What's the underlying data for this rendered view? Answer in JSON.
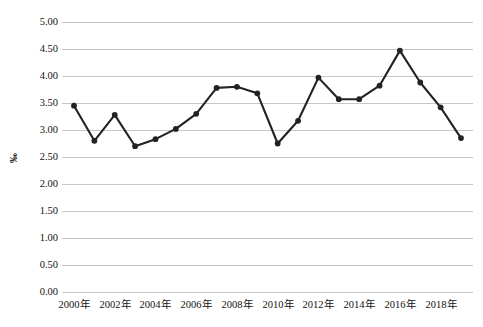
{
  "chart_data": {
    "type": "line",
    "title": "",
    "subtitle": "",
    "xlabel": "",
    "ylabel": "‰",
    "ylim": [
      0.0,
      5.0
    ],
    "y_ticks": [
      "0.00",
      "0.50",
      "1.00",
      "1.50",
      "2.00",
      "2.50",
      "3.00",
      "3.50",
      "4.00",
      "4.50",
      "5.00"
    ],
    "y_tick_values": [
      0.0,
      0.5,
      1.0,
      1.5,
      2.0,
      2.5,
      3.0,
      3.5,
      4.0,
      4.5,
      5.0
    ],
    "grid": true,
    "legend": false,
    "legend_position": "none",
    "marker": "filled-circle",
    "line_color": "#222222",
    "marker_color": "#222222",
    "gridline_color": "#c7c7c7",
    "x": [
      2000,
      2001,
      2002,
      2003,
      2004,
      2005,
      2006,
      2007,
      2008,
      2009,
      2010,
      2011,
      2012,
      2013,
      2014,
      2015,
      2016,
      2017,
      2018,
      2019
    ],
    "x_tick_labels": [
      "2000年",
      "2002年",
      "2004年",
      "2006年",
      "2008年",
      "2010年",
      "2012年",
      "2014年",
      "2016年",
      "2018年"
    ],
    "x_tick_values": [
      2000,
      2002,
      2004,
      2006,
      2008,
      2010,
      2012,
      2014,
      2016,
      2018
    ],
    "values": [
      3.45,
      2.8,
      3.28,
      2.7,
      2.83,
      3.02,
      3.3,
      3.78,
      3.8,
      3.68,
      2.75,
      3.17,
      3.97,
      3.57,
      3.57,
      3.82,
      4.47,
      3.88,
      3.42,
      2.85
    ],
    "series": [
      {
        "name": "",
        "values": [
          3.45,
          2.8,
          3.28,
          2.7,
          2.83,
          3.02,
          3.3,
          3.78,
          3.8,
          3.68,
          2.75,
          3.17,
          3.97,
          3.57,
          3.57,
          3.82,
          4.47,
          3.88,
          3.42,
          2.85
        ]
      }
    ]
  }
}
